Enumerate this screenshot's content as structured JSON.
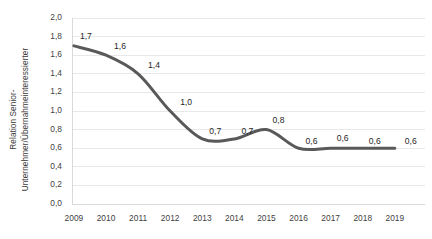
{
  "chart_data": {
    "type": "line",
    "title": "",
    "subtitle": "",
    "xlabel": "",
    "ylabel": "Relation Senior-Unternehmer/Übernahmeinteressierter",
    "ylabel_lines": [
      "Relation Senior-",
      "Unternehmer/Übernahmeinteressierter"
    ],
    "categories": [
      "2009",
      "2010",
      "2011",
      "2012",
      "2013",
      "2014",
      "2015",
      "2016",
      "2017",
      "2018",
      "2019"
    ],
    "values": [
      1.7,
      1.6,
      1.4,
      1.0,
      0.7,
      0.7,
      0.8,
      0.6,
      0.6,
      0.6,
      0.6
    ],
    "data_labels": [
      "1,7",
      "1,6",
      "1,4",
      "1,0",
      "0,7",
      "0,7",
      "0,8",
      "0,6",
      "0,6",
      "0,6",
      "0,6"
    ],
    "ylim": [
      0.0,
      2.0
    ],
    "ytick_values": [
      0.0,
      0.2,
      0.4,
      0.6,
      0.8,
      1.0,
      1.2,
      1.4,
      1.6,
      1.8,
      2.0
    ],
    "ytick_labels": [
      "0,0",
      "0,2",
      "0,4",
      "0,6",
      "0,8",
      "1,0",
      "1,2",
      "1,4",
      "1,6",
      "1,8",
      "2,0"
    ],
    "grid": true,
    "grid_axis": "y",
    "legend": false,
    "legend_position": "none",
    "smoothing": true,
    "markers": false,
    "line_color": "#595959",
    "grid_color": "#e8e8e8",
    "axis_color": "#d9d9d9",
    "text_color": "#3f3f3f",
    "background_color": "#ffffff",
    "line_width": 3
  }
}
